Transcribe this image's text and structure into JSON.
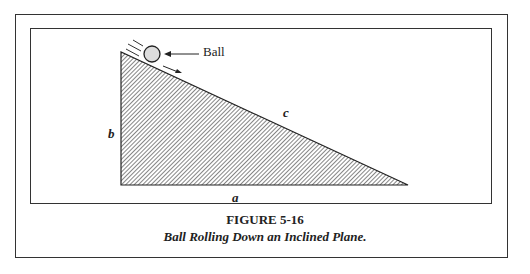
{
  "figure": {
    "number_label": "FIGURE 5-16",
    "caption": "Ball Rolling Down an Inclined Plane."
  },
  "diagram": {
    "ball_label": "Ball",
    "side_labels": {
      "a": "a",
      "b": "b",
      "c": "c"
    }
  }
}
